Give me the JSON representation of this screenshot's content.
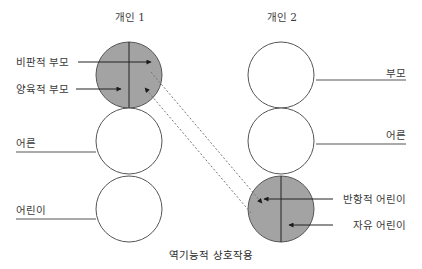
{
  "diagram": {
    "caption": "역기능적 상호작용",
    "colors": {
      "shaded_fill": "#a3a3a3",
      "empty_fill": "#ffffff",
      "stroke": "#555555",
      "text": "#3a3a3a"
    },
    "individuals": [
      {
        "title": "개인 1",
        "states": [
          {
            "name": "parent",
            "shaded": true,
            "labels": [
              "비판적 부모",
              "양육적 부모"
            ]
          },
          {
            "name": "adult",
            "shaded": false,
            "label": "어른"
          },
          {
            "name": "child",
            "shaded": false,
            "label": "어린이"
          }
        ]
      },
      {
        "title": "개인 2",
        "states": [
          {
            "name": "parent",
            "shaded": false,
            "label": "부모"
          },
          {
            "name": "adult",
            "shaded": false,
            "label": "어른"
          },
          {
            "name": "child",
            "shaded": true,
            "labels": [
              "반항적 어린이",
              "자유 어린이"
            ]
          }
        ]
      }
    ],
    "transactions": [
      {
        "from": "개인 1 비판적 부모",
        "to": "개인 2 반항적 어린이",
        "style": "dashed"
      },
      {
        "from": "개인 2 자유 어린이",
        "to": "개인 1 양육적 부모",
        "style": "dashed"
      }
    ]
  }
}
